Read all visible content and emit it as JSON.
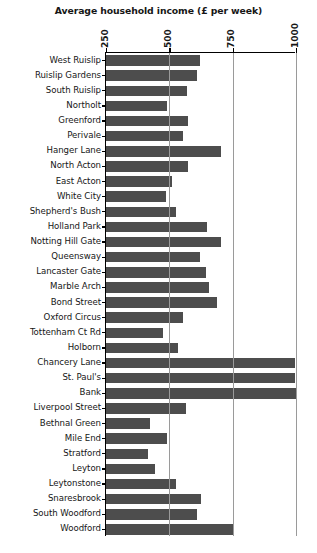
{
  "chart_data": {
    "type": "bar",
    "orientation": "horizontal",
    "title": "Average household income (£ per week)",
    "xlabel": "",
    "ylabel": "",
    "xlim": [
      250,
      1000
    ],
    "ylim": null,
    "grid": true,
    "legend": null,
    "xticks": [
      250,
      500,
      750,
      1000
    ],
    "xticklabels": [
      "250",
      "500",
      "750",
      "1000"
    ],
    "bar_color": "#4d4d4d",
    "axis_color": "#000000",
    "gridline_color": "#9a9a9a",
    "background_color": "#ffffff",
    "note": "Bars are clipped at the left axis which begins at 250; bar length encodes average household income in £ per week.",
    "categories": [
      "West Ruislip",
      "Ruislip Gardens",
      "South Ruislip",
      "Northolt",
      "Greenford",
      "Perivale",
      "Hanger Lane",
      "North Acton",
      "East Acton",
      "White City",
      "Shepherd's Bush",
      "Holland Park",
      "Notting Hill Gate",
      "Queensway",
      "Lancaster Gate",
      "Marble Arch",
      "Bond Street",
      "Oxford Circus",
      "Tottenham Ct Rd",
      "Holborn",
      "Chancery Lane",
      "St. Paul's",
      "Bank",
      "Liverpool Street",
      "Bethnal Green",
      "Mile End",
      "Stratford",
      "Leyton",
      "Leytonstone",
      "Snaresbrook",
      "South Woodford",
      "Woodford"
    ],
    "values": [
      620,
      610,
      570,
      490,
      575,
      555,
      705,
      575,
      510,
      485,
      525,
      650,
      705,
      620,
      645,
      655,
      690,
      555,
      475,
      535,
      995,
      995,
      1000,
      565,
      425,
      490,
      415,
      445,
      525,
      625,
      610,
      750
    ]
  }
}
